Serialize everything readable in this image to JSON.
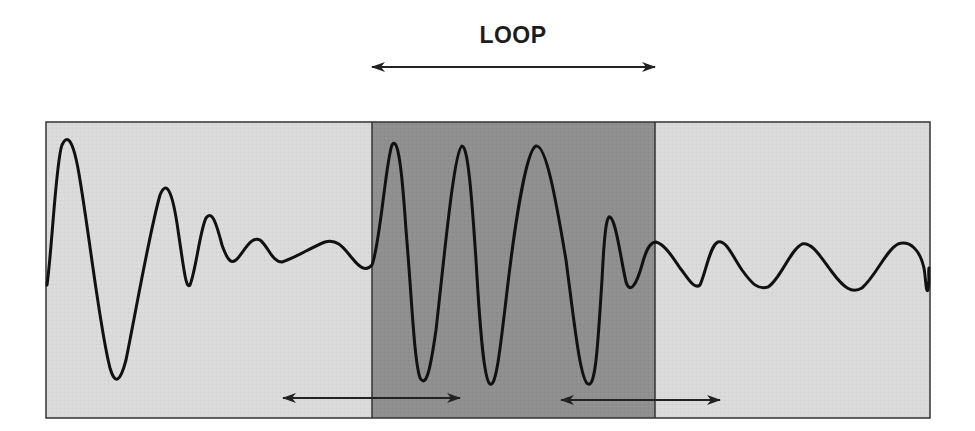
{
  "title": "LOOP",
  "colors": {
    "background": "#ffffff",
    "outer_region": "#d9d9d9",
    "loop_region": "#8f8f8f",
    "waveform": "#111111",
    "border": "#333333",
    "arrow": "#222222"
  },
  "regions": [
    {
      "name": "pre-loop",
      "x_start": 46,
      "x_end": 372,
      "shade": "light"
    },
    {
      "name": "loop",
      "x_start": 372,
      "x_end": 655,
      "shade": "dark"
    },
    {
      "name": "post-loop",
      "x_start": 655,
      "x_end": 930,
      "shade": "light"
    }
  ],
  "arrows": [
    {
      "name": "loop-span-arrow",
      "x1": 372,
      "x2": 655,
      "y": 67,
      "heads": "both"
    },
    {
      "name": "crossfade-start-arrow",
      "x1": 283,
      "x2": 460,
      "y": 398,
      "heads": "both"
    },
    {
      "name": "crossfade-end-arrow",
      "x1": 561,
      "x2": 720,
      "y": 400,
      "heads": "both"
    }
  ]
}
